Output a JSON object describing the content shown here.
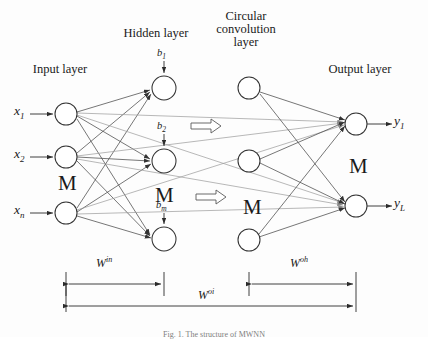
{
  "figure": {
    "title_caption": "Fig. 1.  The structure of MWNN",
    "background": "#fdfdfd",
    "ink": "#1a1a1a"
  },
  "layer_titles": {
    "input": "Input layer",
    "hidden": "Hidden layer",
    "circular_convolution_line1": "Circular",
    "circular_convolution_line2": "convolution",
    "circular_convolution_line3": "layer",
    "output": "Output layer"
  },
  "inputs": [
    {
      "name": "x",
      "sub": "1"
    },
    {
      "name": "x",
      "sub": "2"
    },
    {
      "name": "x",
      "sub": "n"
    }
  ],
  "outputs": [
    {
      "name": "y",
      "sub": "1"
    },
    {
      "name": "y",
      "sub": "L"
    }
  ],
  "biases": [
    {
      "name": "b",
      "sub": "1"
    },
    {
      "name": "b",
      "sub": "2"
    },
    {
      "name": "b",
      "sub": "m"
    }
  ],
  "ellipses": {
    "input_layer": "M",
    "hidden_layer": "M",
    "convolution_layer": "M",
    "output_layer": "M"
  },
  "weight_labels": [
    {
      "base": "W",
      "sup": "in"
    },
    {
      "base": "W",
      "sup": "oh"
    },
    {
      "base": "W",
      "sup": "oi"
    }
  ],
  "nodes": {
    "input": [
      {
        "cx": 66,
        "cy": 114,
        "r": 11
      },
      {
        "cx": 66,
        "cy": 157,
        "r": 11
      },
      {
        "cx": 66,
        "cy": 213,
        "r": 11
      }
    ],
    "hidden": [
      {
        "cx": 164,
        "cy": 88,
        "r": 12
      },
      {
        "cx": 164,
        "cy": 161,
        "r": 12
      },
      {
        "cx": 164,
        "cy": 239,
        "r": 12
      }
    ],
    "convolution": [
      {
        "cx": 249,
        "cy": 88,
        "r": 11
      },
      {
        "cx": 249,
        "cy": 161,
        "r": 11
      },
      {
        "cx": 249,
        "cy": 240,
        "r": 11
      }
    ],
    "output": [
      {
        "cx": 356,
        "cy": 124,
        "r": 11
      },
      {
        "cx": 356,
        "cy": 206,
        "r": 11
      }
    ]
  },
  "colors": {
    "edge_dark": "#4a4a4a",
    "edge_light": "#9a9a9a",
    "node_stroke": "#333333",
    "node_fill": "#ffffff",
    "arrow_hollow_stroke": "#5a5a5a"
  }
}
